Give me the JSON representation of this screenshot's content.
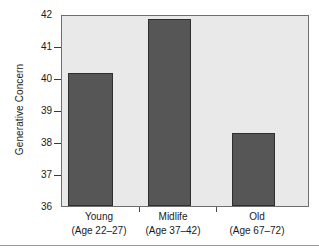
{
  "chart_data": {
    "type": "bar",
    "title": "",
    "xlabel": "",
    "ylabel": "Generative Concern",
    "categories": [
      "Young",
      "Midlife",
      "Old"
    ],
    "category_sublabels": [
      "(Age 22–27)",
      "(Age 37–42)",
      "(Age 67–72)"
    ],
    "values": [
      40.2,
      41.9,
      38.3
    ],
    "ylim": [
      36,
      42
    ],
    "yticks": [
      36,
      37,
      38,
      39,
      40,
      41,
      42
    ],
    "ytick_labels": [
      "36",
      "37",
      "38",
      "39",
      "40",
      "41",
      "42"
    ],
    "grid": false,
    "legend": null,
    "bar_color": "#565656",
    "bar_edge_color": "#2e2e2e",
    "plot_background": "#e9e9e9",
    "axis_color": "#6f6f6f",
    "text_color": "#1a1a1a"
  }
}
